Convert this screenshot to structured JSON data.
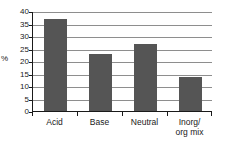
{
  "chart_data": {
    "type": "bar",
    "title": "",
    "subtitle": "",
    "xlabel": "",
    "ylabel": "%",
    "categories": [
      "Acid",
      "Base",
      "Neutral",
      "Inorg/\norg mix"
    ],
    "values": [
      37,
      23,
      27,
      13.5
    ],
    "ylim": [
      0,
      40
    ],
    "y_ticks": [
      0,
      5,
      10,
      15,
      20,
      25,
      30,
      35,
      40
    ],
    "y_tick_labels": [
      "0",
      "5",
      "10",
      "15",
      "20",
      "25",
      "30",
      "35",
      "40"
    ],
    "grid": true,
    "grid_axis": "y",
    "legend": false,
    "legend_position": "none",
    "series": [
      {
        "name": "",
        "values": [
          37,
          23,
          27,
          13.5
        ]
      }
    ],
    "bar_color": "#555555",
    "grid_color": "#8e8e8e",
    "axis_color": "#1a1a1a",
    "background_color": "#ffffff"
  }
}
